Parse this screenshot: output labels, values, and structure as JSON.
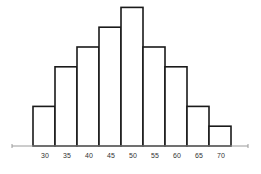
{
  "chart_data": {
    "type": "bar",
    "subtype": "histogram",
    "title": "",
    "xlabel": "",
    "ylabel": "",
    "categories": [
      "30",
      "35",
      "40",
      "45",
      "50",
      "55",
      "60",
      "65",
      "70"
    ],
    "values": [
      2,
      4,
      5,
      6,
      7,
      5,
      4,
      2,
      1
    ],
    "ylim": [
      0,
      7
    ],
    "grid": false,
    "legend": null,
    "y_axis_visible": false
  },
  "colors": {
    "bar_fill": "#ffffff",
    "bar_stroke": "#1a1a1a",
    "axis": "#9a9a9a"
  }
}
